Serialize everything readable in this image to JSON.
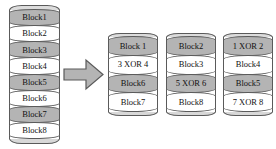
{
  "diagram": {
    "background_color": "#ffffff",
    "shaded_block_color": "#b4b4b4",
    "plain_block_color": "#ffffff",
    "outline_color": "#5a5a5a",
    "arrow": {
      "name": "transform-arrow",
      "direction": "right",
      "fill_color": "#b4b4b4",
      "outline_color": "#5a5a5a"
    },
    "source_disk": {
      "name": "source-disk",
      "blocks": [
        {
          "label": "Block1",
          "shaded": true
        },
        {
          "label": "Block2",
          "shaded": false
        },
        {
          "label": "Block3",
          "shaded": true
        },
        {
          "label": "Block4",
          "shaded": false
        },
        {
          "label": "Block5",
          "shaded": true
        },
        {
          "label": "Block6",
          "shaded": false
        },
        {
          "label": "Block7",
          "shaded": true
        },
        {
          "label": "Block8",
          "shaded": false
        }
      ]
    },
    "target_disks": [
      {
        "name": "target-disk-1",
        "blocks": [
          {
            "label": "Block 1",
            "shaded": true
          },
          {
            "label": "3 XOR 4",
            "shaded": false
          },
          {
            "label": "Block6",
            "shaded": true
          },
          {
            "label": "Block7",
            "shaded": false
          }
        ]
      },
      {
        "name": "target-disk-2",
        "blocks": [
          {
            "label": "Block2",
            "shaded": true
          },
          {
            "label": "Block3",
            "shaded": false
          },
          {
            "label": "5 XOR 6",
            "shaded": true
          },
          {
            "label": "Block8",
            "shaded": false
          }
        ]
      },
      {
        "name": "target-disk-3",
        "blocks": [
          {
            "label": "1 XOR 2",
            "shaded": true
          },
          {
            "label": "Block4",
            "shaded": false
          },
          {
            "label": "Block5",
            "shaded": true
          },
          {
            "label": "7 XOR 8",
            "shaded": false
          }
        ]
      }
    ]
  }
}
